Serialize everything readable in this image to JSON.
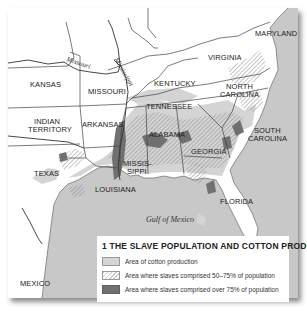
{
  "map": {
    "title": "1 The slave population and cotton production",
    "water_label": "Gulf of Mexico",
    "rivers": [
      {
        "name": "Missouri"
      },
      {
        "name": "Mississippi"
      }
    ],
    "states": [
      {
        "name": "KANSAS"
      },
      {
        "name": "MISSOURI"
      },
      {
        "name": "INDIAN TERRITORY"
      },
      {
        "name": "ARKANSAS"
      },
      {
        "name": "TEXAS"
      },
      {
        "name": "LOUISIANA"
      },
      {
        "name": "MISSISSIPPI"
      },
      {
        "name": "ALABAMA"
      },
      {
        "name": "TENNESSEE"
      },
      {
        "name": "KENTUCKY"
      },
      {
        "name": "VIRGINIA"
      },
      {
        "name": "MARYLAND"
      },
      {
        "name": "NORTH CAROLINA"
      },
      {
        "name": "SOUTH CAROLINA"
      },
      {
        "name": "GEORGIA"
      },
      {
        "name": "FLORIDA"
      },
      {
        "name": "MEXICO"
      }
    ],
    "labels": {
      "kansas": "KANSAS",
      "missouri": "MISSOURI",
      "indian1": "INDIAN",
      "indian2": "TERRITORY",
      "arkansas": "ARKANSAS",
      "texas": "TEXAS",
      "louisiana": "LOUISIANA",
      "miss1": "MISSIS-",
      "miss2": "SIPPI",
      "alabama": "ALABAMA",
      "tennessee": "TENNESSEE",
      "kentucky": "KENTUCKY",
      "virginia": "VIRGINIA",
      "maryland": "MARYLAND",
      "nc1": "NORTH",
      "nc2": "CAROLINA",
      "sc1": "SOUTH",
      "sc2": "CAROLINA",
      "georgia": "GEORGIA",
      "florida": "FLORIDA",
      "mexico": "MEXICO",
      "river_missouri": "Missouri",
      "river_mississippi": "Mississippi"
    }
  },
  "legend": {
    "title": "1 The slave population and cotton production",
    "title_display": "1 THE SLAVE POPULATION AND COTTON PRODUCTION",
    "items": [
      {
        "label": "Area of cotton production",
        "style": "light-gray"
      },
      {
        "label": "Area where slaves comprised 50–75% of population",
        "style": "hatched"
      },
      {
        "label": "Area where slaves comprised over 75% of population",
        "style": "dark-gray"
      }
    ]
  },
  "colors": {
    "water": "#c8c8c8",
    "land": "#ffffff",
    "cotton": "#d4d4d4",
    "slaves_over_75": "#707070",
    "border": "#444444"
  }
}
